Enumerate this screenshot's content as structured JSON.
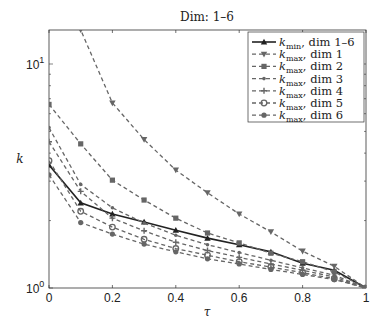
{
  "chart_data": {
    "type": "line",
    "title": "Dim: 1–6",
    "xlabel": "τ",
    "ylabel": "k",
    "xlim": [
      0,
      1
    ],
    "ylim": [
      1,
      14.2
    ],
    "yscale": "log",
    "grid": false,
    "legend_position": "upper right",
    "x": [
      0,
      0.1,
      0.2,
      0.3,
      0.4,
      0.5,
      0.6,
      0.7,
      0.8,
      0.9,
      1.0
    ],
    "xticks": [
      "0",
      "0.2",
      "0.4",
      "0.6",
      "0.8",
      "1"
    ],
    "yticks": [
      "10^0",
      "10^1"
    ],
    "series": [
      {
        "name": "k_min, dim 1–6",
        "style": "solid",
        "marker": "triangle-up",
        "values": [
          3.54,
          2.4,
          2.14,
          1.97,
          1.81,
          1.67,
          1.56,
          1.45,
          1.29,
          1.2,
          1.0
        ]
      },
      {
        "name": "k_max, dim 1",
        "style": "dashed",
        "marker": "triangle-down",
        "values": [
          22,
          14.2,
          6.7,
          4.6,
          3.36,
          2.66,
          2.14,
          1.78,
          1.46,
          1.25,
          1.0
        ]
      },
      {
        "name": "k_max, dim 2",
        "style": "dashed",
        "marker": "square",
        "values": [
          6.6,
          4.4,
          3.03,
          2.47,
          2.05,
          1.76,
          1.59,
          1.43,
          1.31,
          1.18,
          1.0
        ]
      },
      {
        "name": "k_max, dim 3",
        "style": "dashed",
        "marker": "dot",
        "values": [
          5.2,
          2.9,
          2.28,
          1.95,
          1.72,
          1.56,
          1.44,
          1.33,
          1.23,
          1.14,
          1.0
        ]
      },
      {
        "name": "k_max, dim 4",
        "style": "dashed",
        "marker": "plus",
        "values": [
          4.5,
          2.7,
          2.05,
          1.8,
          1.6,
          1.47,
          1.37,
          1.28,
          1.2,
          1.12,
          1.0
        ]
      },
      {
        "name": "k_max, dim 5",
        "style": "dashed",
        "marker": "circle",
        "values": [
          3.7,
          2.2,
          1.87,
          1.65,
          1.5,
          1.4,
          1.31,
          1.24,
          1.17,
          1.1,
          1.0
        ]
      },
      {
        "name": "k_max, dim 6",
        "style": "dashed",
        "marker": "filled-circle",
        "values": [
          3.2,
          1.96,
          1.74,
          1.57,
          1.45,
          1.35,
          1.28,
          1.21,
          1.15,
          1.09,
          1.0
        ]
      }
    ]
  },
  "labels": {
    "title": "Dim: 1–6",
    "xlabel": "τ",
    "ylabel": "k",
    "ytick_0": "10",
    "ytick_0_exp": "0",
    "ytick_1": "10",
    "ytick_1_exp": "1"
  },
  "legend": [
    {
      "k": "k",
      "sub": "min",
      "rest": ", dim 1–6"
    },
    {
      "k": "k",
      "sub": "max",
      "rest": ", dim 1"
    },
    {
      "k": "k",
      "sub": "max",
      "rest": ", dim 2"
    },
    {
      "k": "k",
      "sub": "max",
      "rest": ", dim 3"
    },
    {
      "k": "k",
      "sub": "max",
      "rest": ", dim 4"
    },
    {
      "k": "k",
      "sub": "max",
      "rest": ", dim 5"
    },
    {
      "k": "k",
      "sub": "max",
      "rest": ", dim 6"
    }
  ]
}
